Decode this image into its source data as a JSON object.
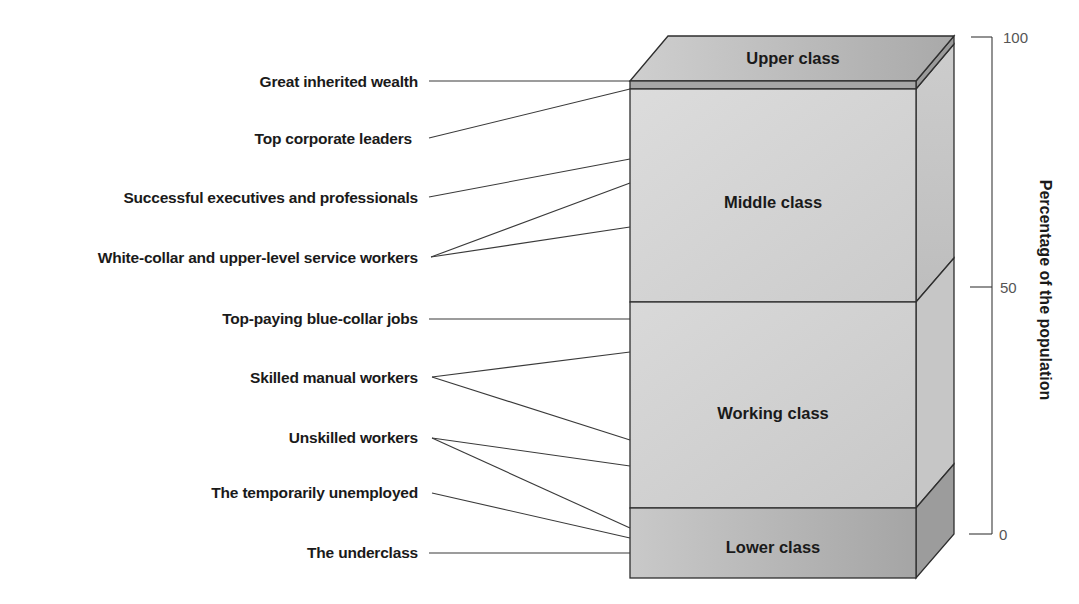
{
  "diagram": {
    "classes": [
      {
        "label": "Upper class",
        "range": [
          99,
          100
        ]
      },
      {
        "label": "Middle class",
        "range": [
          46,
          99
        ]
      },
      {
        "label": "Working class",
        "range": [
          14,
          46
        ]
      },
      {
        "label": "Lower class",
        "range": [
          0,
          14
        ]
      }
    ],
    "occupations": [
      {
        "label": "Great inherited wealth",
        "connects_to": [
          "Upper class"
        ]
      },
      {
        "label": "Top corporate leaders",
        "connects_to": [
          "Middle class (top)"
        ]
      },
      {
        "label": "Successful executives and professionals",
        "connects_to": [
          "Middle class"
        ]
      },
      {
        "label": "White-collar and upper-level service workers",
        "connects_to": [
          "Middle class",
          "Middle class"
        ]
      },
      {
        "label": "Top-paying blue-collar jobs",
        "connects_to": [
          "Working class"
        ]
      },
      {
        "label": "Skilled manual workers",
        "connects_to": [
          "Working class",
          "Working class"
        ]
      },
      {
        "label": "Unskilled workers",
        "connects_to": [
          "Working class",
          "Lower class"
        ]
      },
      {
        "label": "The temporarily unemployed",
        "connects_to": [
          "Lower class"
        ]
      },
      {
        "label": "The underclass",
        "connects_to": [
          "Lower class"
        ]
      }
    ],
    "axis": {
      "title": "Percentage of the population",
      "ticks": [
        "100",
        "50",
        "0"
      ]
    }
  },
  "colors": {
    "top_face": "#b9b9b9",
    "upper_front": "#a8a8a8",
    "middle_front": "#d4d4d4",
    "working_front": "#d0d0d0",
    "lower_front": "#b5b5b5",
    "side": "#c4c4c4",
    "lower_side": "#9a9a9a"
  }
}
